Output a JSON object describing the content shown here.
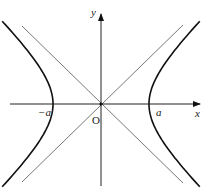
{
  "diagram": {
    "labels": {
      "x_axis": "x",
      "y_axis": "y",
      "origin": "O",
      "left_vertex": "−a",
      "right_vertex": "a"
    },
    "geometry": {
      "origin": [
        101,
        104
      ],
      "a_px": 48,
      "b_px": 46
    },
    "colors": {
      "curve": "#111111",
      "axis": "#222222",
      "asymptote": "#555555"
    }
  }
}
